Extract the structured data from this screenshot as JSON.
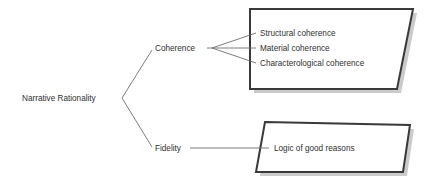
{
  "diagram": {
    "title": "Narrative Rationality",
    "background_color": "#ffffff",
    "line_color": "#6d6d6d",
    "shape_border_color": "#3a3a3a",
    "shape_fill_color": "#ffffff",
    "shadow_color": "#b9b9b9",
    "text_color": "#2f2f2f",
    "root": {
      "label": "Narrative Rationality"
    },
    "branches": [
      {
        "label": "Coherence",
        "children": [
          {
            "label": "Structural coherence"
          },
          {
            "label": "Material coherence"
          },
          {
            "label": "Characterological coherence"
          }
        ]
      },
      {
        "label": "Fidelity",
        "children": [
          {
            "label": "Logic of good reasons"
          }
        ]
      }
    ]
  }
}
